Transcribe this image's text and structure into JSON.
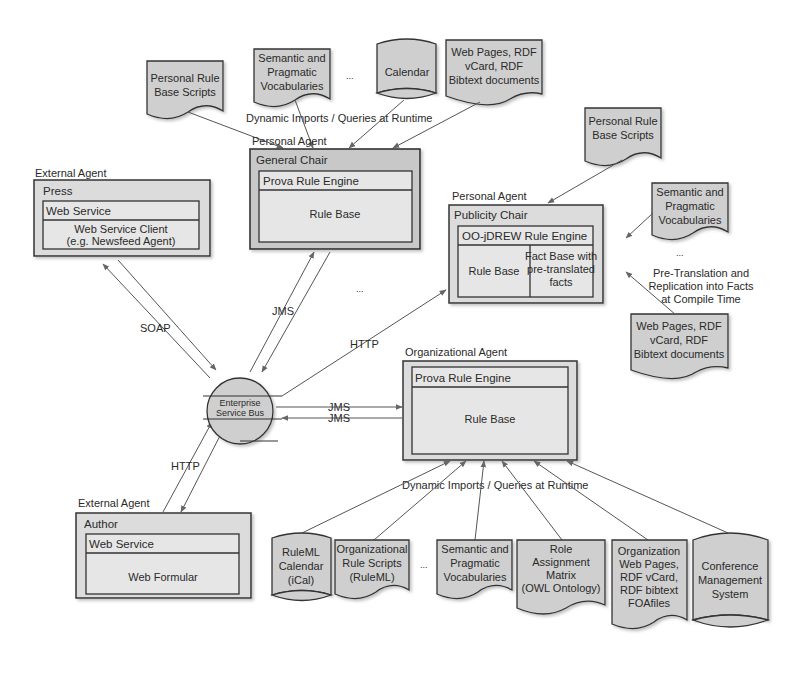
{
  "diagram": {
    "top_labels": {
      "dynamic_imports_top": "Dynamic Imports / Queries at Runtime",
      "dynamic_imports_bottom": "Dynamic Imports / Queries at Runtime",
      "pre_translation": [
        "Pre-Translation and",
        "Replication into Facts",
        "at Compile Time"
      ],
      "ellipsis": "..."
    },
    "top_sources": [
      {
        "id": "personal-rule-base-scripts-1",
        "shape": "document",
        "lines": [
          "Personal Rule",
          "Base Scripts"
        ]
      },
      {
        "id": "semantic-vocabularies-1",
        "shape": "document",
        "lines": [
          "Semantic and",
          "Pragmatic",
          "Vocabularies"
        ]
      },
      {
        "id": "calendar",
        "shape": "cylinder",
        "lines": [
          "Calendar"
        ]
      },
      {
        "id": "web-pages-1",
        "shape": "document",
        "lines": [
          "Web Pages, RDF",
          "vCard, RDF",
          "Bibtext documents"
        ]
      }
    ],
    "publicity_sources": [
      {
        "id": "personal-rule-base-scripts-2",
        "shape": "document",
        "lines": [
          "Personal Rule",
          "Base Scripts"
        ]
      },
      {
        "id": "semantic-vocabularies-2",
        "shape": "document",
        "lines": [
          "Semantic and",
          "Pragmatic",
          "Vocabularies"
        ]
      },
      {
        "id": "web-pages-2",
        "shape": "document",
        "lines": [
          "Web Pages, RDF",
          "vCard, RDF",
          "Bibtext documents"
        ]
      }
    ],
    "agents": {
      "press": {
        "type": "External Agent",
        "name": "Press",
        "inner_header": "Web Service",
        "inner_body": [
          "Web Service Client",
          "(e.g. Newsfeed Agent)"
        ]
      },
      "general_chair": {
        "type": "Personal Agent",
        "name": "General Chair",
        "inner_header": "Prova Rule Engine",
        "inner_body": [
          "Rule Base"
        ]
      },
      "publicity_chair": {
        "type": "Personal Agent",
        "name": "Publicity Chair",
        "inner_header": "OO-jDREW Rule Engine",
        "rule_base": "Rule Base",
        "fact_base": [
          "Fact Base with",
          "pre-translated",
          "facts"
        ]
      },
      "organizational": {
        "type": "Organizational Agent",
        "inner_header": "Prova Rule Engine",
        "inner_body": [
          "Rule Base"
        ]
      },
      "author": {
        "type": "External Agent",
        "name": "Author",
        "inner_header": "Web Service",
        "inner_body": [
          "Web Formular"
        ]
      }
    },
    "bus": {
      "lines": [
        "Enterprise",
        "Service Bus"
      ]
    },
    "connections": {
      "soap": "SOAP",
      "jms_general": "JMS",
      "http_publicity": "HTTP",
      "jms_out": "JMS",
      "jms_in": "JMS",
      "http_author": "HTTP"
    },
    "bottom_sources": [
      {
        "id": "ruleml-calendar",
        "shape": "cylinder",
        "lines": [
          "RuleML",
          "Calendar",
          "(iCal)"
        ]
      },
      {
        "id": "org-rule-scripts",
        "shape": "document",
        "lines": [
          "Organizational",
          "Rule Scripts",
          "(RuleML)"
        ]
      },
      {
        "id": "semantic-vocabularies-3",
        "shape": "document",
        "lines": [
          "Semantic and",
          "Pragmatic",
          "Vocabularies"
        ]
      },
      {
        "id": "role-matrix",
        "shape": "document",
        "lines": [
          "Role",
          "Assignment",
          "Matrix",
          "(OWL Ontology)"
        ]
      },
      {
        "id": "org-web-pages",
        "shape": "document",
        "lines": [
          "Organization",
          "Web Pages,",
          "RDF vCard,",
          "RDF bibtext",
          "FOAfiles"
        ]
      },
      {
        "id": "conference-mgmt",
        "shape": "cylinder",
        "lines": [
          "Conference",
          "Management",
          "System"
        ]
      }
    ]
  }
}
